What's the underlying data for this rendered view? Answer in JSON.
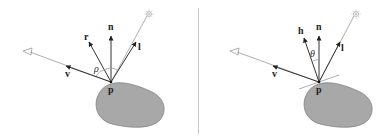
{
  "panels": [
    {
      "name": "phong-reflection",
      "labels": {
        "n": "n",
        "r": "r",
        "l": "l",
        "v": "v",
        "p": "p",
        "angle": "ρ"
      }
    },
    {
      "name": "blinn-phong-halfway",
      "labels": {
        "n": "n",
        "h": "h",
        "l": "l",
        "v": "v",
        "p": "p",
        "angle": "θ"
      }
    }
  ],
  "colors": {
    "surface": "#a8a8a8",
    "ray": "#333333",
    "guide": "#999999",
    "divider": "#c8c8c8"
  }
}
